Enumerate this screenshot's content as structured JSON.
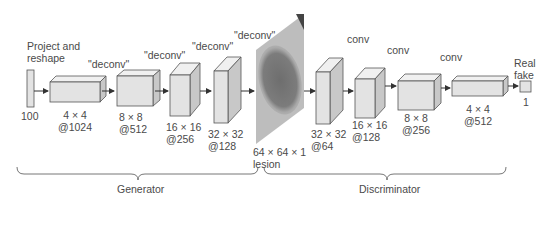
{
  "diagram": {
    "input": {
      "label_top": "Project and",
      "label_top2": "reshape",
      "size": "100"
    },
    "generator_layers": [
      {
        "op": "\"deconv\"",
        "dims": "4 × 4",
        "channels": "@1024"
      },
      {
        "op": "\"deconv\"",
        "dims": "8 × 8",
        "channels": "@512"
      },
      {
        "op": "\"deconv\"",
        "dims": "16 × 16",
        "channels": "@256"
      },
      {
        "op": "\"deconv\"",
        "dims": "32 × 32",
        "channels": "@128"
      }
    ],
    "generated_image": {
      "op": "\"deconv\"",
      "dims": "64 × 64 × 1",
      "caption": "lesion"
    },
    "discriminator_layers": [
      {
        "op": "conv",
        "dims": "32 × 32",
        "channels": "@64"
      },
      {
        "op": "conv",
        "dims": "16 × 16",
        "channels": "@128"
      },
      {
        "op": "conv",
        "dims": "8 × 8",
        "channels": "@256"
      },
      {
        "dims": "4 × 4",
        "channels": "@512"
      }
    ],
    "output": {
      "label_top": "Real",
      "label_top2": "fake",
      "size": "1"
    },
    "groups": {
      "generator": "Generator",
      "discriminator": "Discriminator"
    },
    "colors": {
      "block_face": "#e3e3e3",
      "block_side": "#c8c8c8",
      "block_top": "#f0f0f0",
      "stroke": "#555555",
      "lesion": "#7a7a7a"
    }
  }
}
